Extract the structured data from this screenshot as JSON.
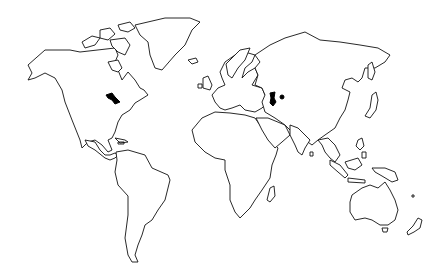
{
  "map": {
    "title": "World map outline",
    "style": "black outline on white",
    "colors": {
      "background": "#ffffff",
      "outline": "#111111",
      "lakes": "#000000"
    },
    "regions": [
      "north-america",
      "greenland",
      "canadian-arctic-islands",
      "central-america",
      "south-america",
      "europe",
      "british-isles",
      "africa",
      "madagascar",
      "asia",
      "arabian-peninsula",
      "india",
      "sri-lanka",
      "japan",
      "southeast-asia",
      "indonesia",
      "new-guinea",
      "australia",
      "tasmania",
      "new-zealand",
      "iceland"
    ],
    "lakes": [
      "great-lakes",
      "caspian-sea",
      "aral-sea"
    ]
  }
}
